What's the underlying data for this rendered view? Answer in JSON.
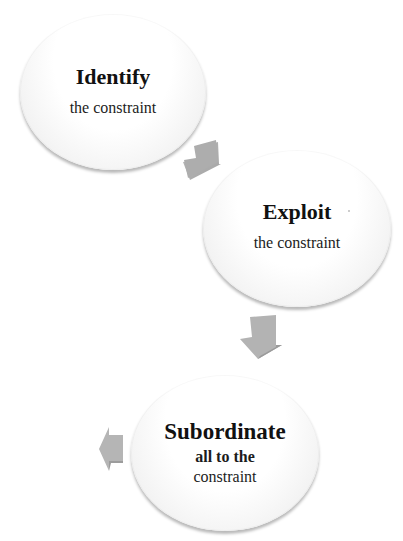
{
  "diagram": {
    "type": "cycle-process",
    "colors": {
      "node_fill": "#ffffff",
      "node_shadow": "#bdbdbd",
      "arrow_fill": "#a9a9a9",
      "text": "#111111"
    },
    "nodes": [
      {
        "title": "Identify",
        "subtitle_lines": [
          "the constraint"
        ]
      },
      {
        "title": "Exploit",
        "subtitle_lines": [
          "the constraint"
        ]
      },
      {
        "title": "Subordinate",
        "subtitle_lines": [
          "all to the",
          "constraint"
        ]
      }
    ],
    "arrows": [
      {
        "from": "Identify",
        "to": "Exploit",
        "direction": "down-right",
        "icon": "arrow-down-right-icon"
      },
      {
        "from": "Exploit",
        "to": "Subordinate",
        "direction": "down-left",
        "icon": "arrow-down-left-icon"
      },
      {
        "from": "Subordinate",
        "to": "next",
        "direction": "left",
        "icon": "arrow-left-icon"
      }
    ]
  }
}
